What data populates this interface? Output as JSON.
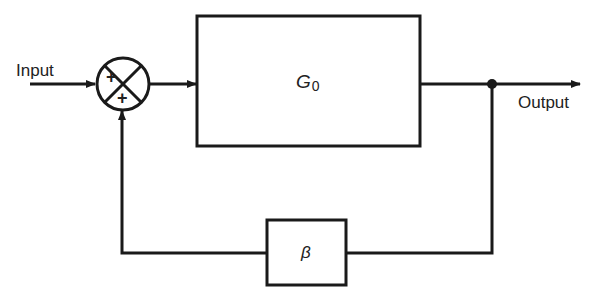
{
  "diagram": {
    "type": "feedback-block-diagram",
    "input_label": "Input",
    "output_label": "Output",
    "forward_block": {
      "label": "G",
      "subscript": "0"
    },
    "feedback_block": {
      "label": "β"
    },
    "summing_junction": {
      "input_sign": "+",
      "feedback_sign": "+"
    },
    "colors": {
      "stroke": "#1a1a1a",
      "background": "#ffffff"
    }
  }
}
